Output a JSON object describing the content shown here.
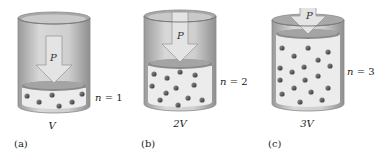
{
  "figure": {
    "panels": [
      {
        "id": "a",
        "caption": "(a)",
        "volume_label": "V",
        "moles_label": "n = 1",
        "n_symbol": "n",
        "n_value": "= 1",
        "pressure_label": "P",
        "molecule_count": 6
      },
      {
        "id": "b",
        "caption": "(b)",
        "volume_label": "2V",
        "moles_label": "n = 2",
        "n_symbol": "n",
        "n_value": "= 2",
        "pressure_label": "P",
        "molecule_count": 12
      },
      {
        "id": "c",
        "caption": "(c)",
        "volume_label": "3V",
        "moles_label": "n = 3",
        "n_symbol": "n",
        "n_value": "= 3",
        "pressure_label": "P",
        "molecule_count": 18
      }
    ],
    "colors": {
      "cylinder_outer": "#bdbdbd",
      "cylinder_inner": "#d6d6d6",
      "gas_fill": "#ebebeb",
      "piston": "#8a8a8a",
      "arrow": "#e2e2e2",
      "molecule": "#4a4a4a"
    }
  }
}
